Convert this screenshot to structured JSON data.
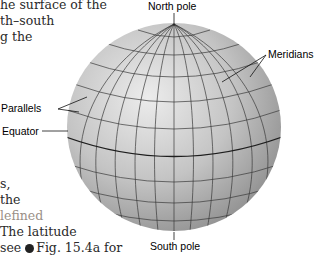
{
  "body_text": {
    "left_top": [
      "he surface of the",
      "th–south",
      "g the"
    ],
    "left_bottom": [
      "s,",
      "the",
      "lefined",
      "The latitude",
      "see",
      "Fig. 15.4a for"
    ]
  },
  "figure": {
    "labels": {
      "north_pole": "North pole",
      "south_pole": "South pole",
      "meridians": "Meridians",
      "parallels": "Parallels",
      "equator": "Equator"
    },
    "colors": {
      "sphere_light": "#e6e6e6",
      "sphere_mid": "#b9b9b9",
      "sphere_dark": "#8c8c8c",
      "grid_line": "#3a3a3a",
      "equator_line": "#222222"
    }
  }
}
